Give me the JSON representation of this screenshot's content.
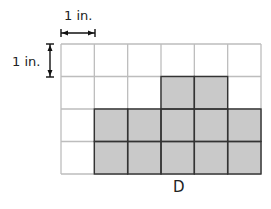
{
  "diagram": {
    "figure_label": "D",
    "scale": {
      "horizontal_label": "1 in.",
      "vertical_label": "1 in."
    },
    "grid": {
      "columns": 6,
      "rows": 4,
      "shaded_cells": [
        {
          "row": 1,
          "col": 3
        },
        {
          "row": 1,
          "col": 4
        },
        {
          "row": 2,
          "col": 1
        },
        {
          "row": 2,
          "col": 2
        },
        {
          "row": 2,
          "col": 3
        },
        {
          "row": 2,
          "col": 4
        },
        {
          "row": 2,
          "col": 5
        },
        {
          "row": 3,
          "col": 1
        },
        {
          "row": 3,
          "col": 2
        },
        {
          "row": 3,
          "col": 3
        },
        {
          "row": 3,
          "col": 4
        },
        {
          "row": 3,
          "col": 5
        }
      ],
      "shaded_count": 12
    },
    "colors": {
      "shade": "#c9c9c9",
      "grid_line": "#bdbdbd",
      "shade_border": "#333333"
    }
  }
}
